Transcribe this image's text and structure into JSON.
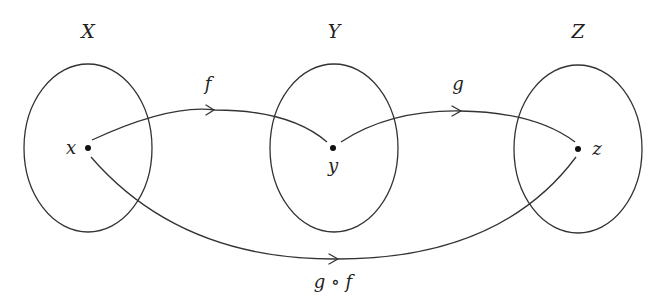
{
  "diagram": {
    "sets": [
      {
        "id": "X",
        "label": "X",
        "element": "x"
      },
      {
        "id": "Y",
        "label": "Y",
        "element": "y"
      },
      {
        "id": "Z",
        "label": "Z",
        "element": "z"
      }
    ],
    "maps": [
      {
        "id": "f",
        "label": "f",
        "from": "x",
        "to": "y"
      },
      {
        "id": "g",
        "label": "g",
        "from": "y",
        "to": "z"
      },
      {
        "id": "gf",
        "label": "g ∘ f",
        "from": "x",
        "to": "z"
      }
    ],
    "colors": {
      "stroke": "#333333",
      "text": "#222222",
      "background": "#ffffff"
    }
  }
}
